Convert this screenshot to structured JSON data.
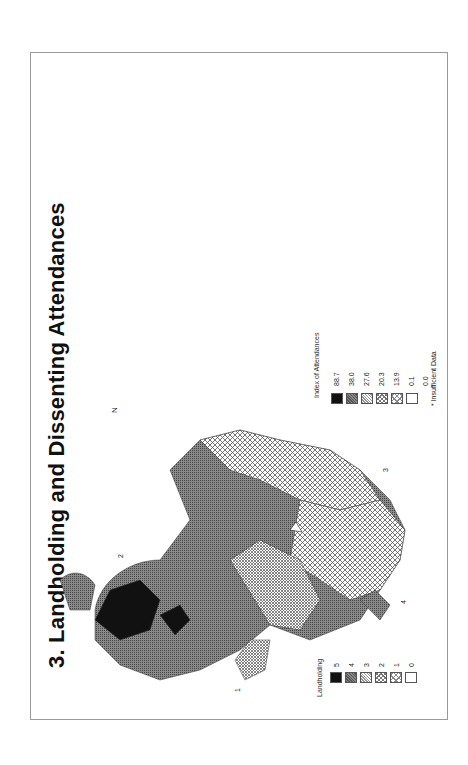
{
  "title": "3. Landholding and Dissenting Attendances",
  "north_arrow_label": "N",
  "left_map": {
    "name": "Landholding",
    "region_labels": [
      "1",
      "2",
      "3",
      "4"
    ],
    "legend": {
      "title": "Landholding",
      "items": [
        {
          "value": "5",
          "fill": "#111111"
        },
        {
          "value": "4",
          "fill": "dense-gray"
        },
        {
          "value": "3",
          "fill": "fine-cross"
        },
        {
          "value": "2",
          "fill": "medium-cross"
        },
        {
          "value": "1",
          "fill": "open-cross"
        },
        {
          "value": "0",
          "fill": "#ffffff"
        }
      ]
    }
  },
  "right_map": {
    "name": "Index of Attendances",
    "legend": {
      "title": "Index of Attendances",
      "items": [
        {
          "value": "88.7",
          "fill": "#111111"
        },
        {
          "value": "38.0",
          "fill": "dense-gray"
        },
        {
          "value": "27.6",
          "fill": "fine-cross"
        },
        {
          "value": "20.3",
          "fill": "medium-cross"
        },
        {
          "value": "13.9",
          "fill": "open-cross"
        },
        {
          "value": "0.1",
          "fill": "open-cross"
        },
        {
          "value": "0.0",
          "fill": "#ffffff"
        }
      ],
      "footnote": "* Insufficient Data"
    }
  },
  "colors": {
    "border": "#9a9a9a",
    "ink": "#111111",
    "mid_gray": "#6e6e6e"
  }
}
